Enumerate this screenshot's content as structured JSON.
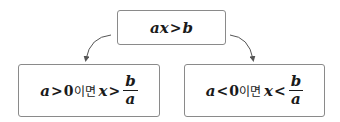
{
  "top": {
    "var_a": "a",
    "var_x": "x",
    "op": ">",
    "var_b": "b"
  },
  "left": {
    "var_a": "a",
    "op1": ">",
    "zero": "0",
    "condition_word": "이면",
    "var_x": "x",
    "op2": ">",
    "num": "b",
    "den": "a"
  },
  "right": {
    "var_a": "a",
    "op1": "<",
    "zero": "0",
    "condition_word": "이면",
    "var_x": "x",
    "op2": "<",
    "num": "b",
    "den": "a"
  },
  "colors": {
    "border": "#8a8a8a",
    "arrow": "#555555",
    "text": "#1a1a1a"
  }
}
